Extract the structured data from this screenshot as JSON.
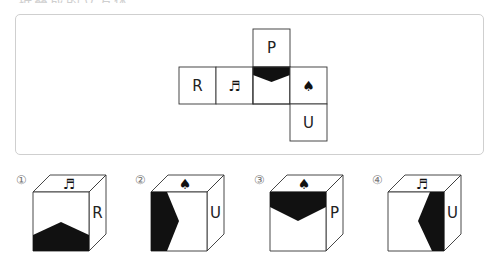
{
  "question": {
    "title_fragment": "折叠成的立方体"
  },
  "net": {
    "faces": [
      {
        "id": "top",
        "label": "P",
        "icon": "letter"
      },
      {
        "id": "r",
        "label": "R",
        "icon": "letter"
      },
      {
        "id": "music",
        "label": "♬",
        "icon": "music-note-icon"
      },
      {
        "id": "shaded",
        "label": "",
        "icon": "shaded-chevron"
      },
      {
        "id": "spade",
        "label": "♠",
        "icon": "spade-icon"
      },
      {
        "id": "u",
        "label": "U",
        "icon": "letter"
      }
    ]
  },
  "options": [
    {
      "number": "①",
      "top": "♬",
      "right": "R",
      "front": "chevron-bottom"
    },
    {
      "number": "②",
      "top": "♠",
      "right": "U",
      "front": "chevron-left"
    },
    {
      "number": "③",
      "top": "♠",
      "right": "P",
      "front": "chevron-top"
    },
    {
      "number": "④",
      "top": "♬",
      "right": "U",
      "front": "chevron-right"
    }
  ]
}
